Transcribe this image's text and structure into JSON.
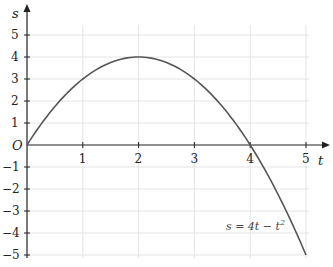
{
  "chart_data": {
    "type": "line",
    "title": "",
    "xlabel": "t",
    "ylabel": "s",
    "origin_label": "O",
    "xlim": [
      0,
      5
    ],
    "ylim": [
      -5,
      5
    ],
    "x_ticks": [
      1,
      2,
      3,
      4,
      5
    ],
    "y_ticks": [
      5,
      4,
      3,
      2,
      1,
      -1,
      -2,
      -3,
      -4,
      -5
    ],
    "grid": true,
    "series": [
      {
        "name": "s = 4t − t²",
        "x": [
          0,
          0.5,
          1,
          1.5,
          2,
          2.5,
          3,
          3.5,
          4,
          4.5,
          5
        ],
        "values": [
          0,
          1.75,
          3,
          3.75,
          4,
          3.75,
          3,
          1.75,
          0,
          -2.25,
          -5
        ]
      }
    ],
    "annotation": "s = 4t − t",
    "annotation_sup": "2"
  },
  "colors": {
    "curve": "#555555",
    "axis": "#222222",
    "grid": "#e4e4e4"
  }
}
